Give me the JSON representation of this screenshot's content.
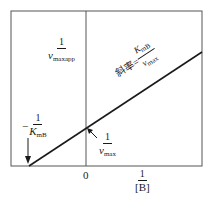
{
  "diagram": {
    "type": "Lineweaver-Burk double-reciprocal plot",
    "frame": {
      "color": "#555555"
    },
    "line": {
      "color": "#1a1a1a"
    },
    "labels": {
      "y_axis_title": {
        "numerator": "1",
        "denominator_var": "v",
        "denominator_sub": "maxapp"
      },
      "slope": {
        "prefix": "斜率=",
        "numerator_var": "K",
        "numerator_sub": "mB",
        "denominator_var": "v",
        "denominator_sub": "max"
      },
      "x_intercept": {
        "sign": "−",
        "numerator": "1",
        "denominator_var": "K",
        "denominator_sub": "mB"
      },
      "y_intercept": {
        "numerator": "1",
        "denominator_var": "v",
        "denominator_sub": "max"
      },
      "origin": "0",
      "x_axis_title": {
        "numerator": "1",
        "denominator": "[B]"
      }
    }
  }
}
